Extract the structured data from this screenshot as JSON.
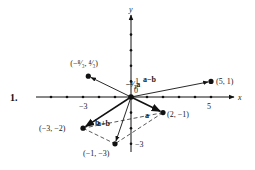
{
  "problem_number": "1.",
  "axes": {
    "x_label": "x",
    "y_label": "y",
    "origin_label": "0",
    "x_tick_labels": [
      {
        "value": -3,
        "text": "−3"
      },
      {
        "value": 5,
        "text": "5"
      }
    ],
    "y_tick_labels": [
      {
        "value": 1,
        "text": "1"
      },
      {
        "value": -3,
        "text": "−3"
      }
    ],
    "x_range": [
      -6,
      6
    ],
    "y_range": [
      -3.4,
      5
    ]
  },
  "points": [
    {
      "id": "a",
      "x": 2,
      "y": -1,
      "label": "(2, −1)"
    },
    {
      "id": "b",
      "x": -3,
      "y": -2,
      "label": "(−3, −2)"
    },
    {
      "id": "apb",
      "x": -1,
      "y": -3,
      "label": "(−1, −3)"
    },
    {
      "id": "amb",
      "x": 5,
      "y": 1,
      "label": "(5, 1)"
    },
    {
      "id": "scaled",
      "x": -2.6667,
      "y": 1.3333,
      "label": "(−⁸⁄₃, ⁴⁄₃)"
    }
  ],
  "vectors": [
    {
      "id": "a",
      "to": "a",
      "label": "a",
      "bold": true
    },
    {
      "id": "b",
      "to": "b",
      "label": "b",
      "bold": true
    },
    {
      "id": "apb",
      "to": "apb",
      "label": "a+b",
      "bold": false
    },
    {
      "id": "amb",
      "to": "amb",
      "label": "a−b",
      "bold": false
    },
    {
      "id": "scaled",
      "to": "scaled",
      "label": "−⁴⁄₃a",
      "bold": false
    }
  ],
  "dashed_segments": [
    {
      "from": "a",
      "to": "b"
    },
    {
      "from": "a",
      "to": "apb"
    },
    {
      "from": "b",
      "to": "apb"
    }
  ]
}
